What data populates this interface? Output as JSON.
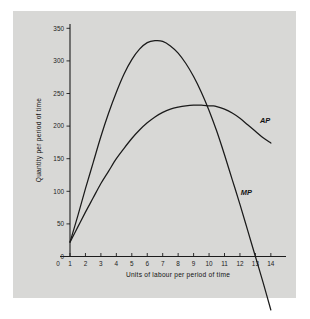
{
  "figure": {
    "background_color": "#ffffff",
    "panel_color": "#d8d8d6",
    "ink_color": "#1a1a1a"
  },
  "chart_data": {
    "type": "line",
    "title": "",
    "xlabel": "Units of labour per period of time",
    "ylabel": "Quantity per period of time",
    "xlim": [
      0,
      14.6
    ],
    "ylim": [
      -60,
      362
    ],
    "grid": false,
    "legend_position": "inline-curve-labels",
    "xticks": [
      1,
      2,
      3,
      4,
      5,
      6,
      7,
      8,
      9,
      10,
      11,
      12,
      13,
      14
    ],
    "xtick_labels": [
      "1",
      "2",
      "3",
      "4",
      "5",
      "6",
      "7",
      "8",
      "9",
      "10",
      "11",
      "12",
      "13",
      "14"
    ],
    "x_origin_label": "0",
    "yticks": [
      0,
      50,
      100,
      150,
      200,
      250,
      300,
      350
    ],
    "ytick_labels": [
      "0",
      "50",
      "100",
      "150",
      "200",
      "250",
      "300",
      "350"
    ],
    "series": [
      {
        "name": "MP",
        "label": "MP",
        "label_x": 12.05,
        "label_y": 95,
        "note": "Marginal product: rises steeply to a peak near 7 units then falls, crossing zero at 13 units",
        "x": [
          1,
          1.5,
          2,
          2.5,
          3,
          3.5,
          4,
          4.5,
          5,
          5.5,
          6,
          6.5,
          7,
          7.5,
          8,
          8.5,
          9,
          9.5,
          10,
          10.5,
          11,
          11.5,
          12,
          12.5,
          13,
          13.5,
          14
        ],
        "values": [
          22,
          62,
          104,
          144,
          184,
          220,
          252,
          280,
          302,
          318,
          328,
          331,
          330,
          323,
          312,
          296,
          276,
          252,
          224,
          192,
          156,
          118,
          80,
          40,
          0,
          -40,
          -82
        ]
      },
      {
        "name": "AP",
        "label": "AP",
        "label_x": 13.3,
        "label_y": 205,
        "note": "Average product: rises to a maximum of about 231 near 10 units where it is cut by MP, then declines",
        "x": [
          1,
          1.5,
          2,
          2.5,
          3,
          3.5,
          4,
          4.5,
          5,
          5.5,
          6,
          6.5,
          7,
          7.5,
          8,
          8.5,
          9,
          9.5,
          10,
          10.25,
          10.5,
          11,
          11.5,
          12,
          12.5,
          13,
          13.5,
          14
        ],
        "values": [
          22,
          45,
          68,
          90,
          112,
          131,
          150,
          166,
          181,
          194,
          205,
          214,
          221,
          226,
          229,
          231,
          232,
          232,
          231,
          231,
          230,
          226,
          220,
          212,
          202,
          192,
          182,
          174
        ]
      }
    ],
    "annotations": [
      {
        "text": "AP",
        "x": 13.3,
        "y": 205
      },
      {
        "text": "MP",
        "x": 12.05,
        "y": 95
      }
    ]
  }
}
